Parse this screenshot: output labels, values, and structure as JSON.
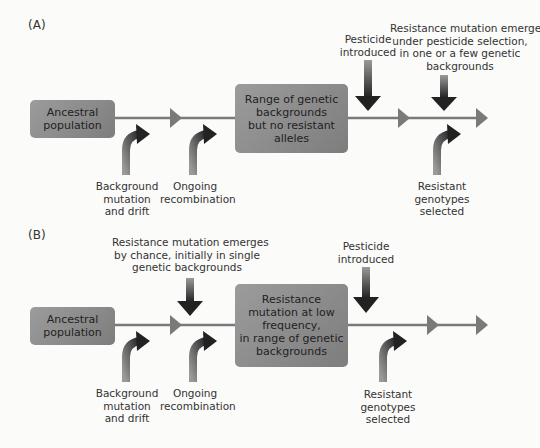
{
  "panels": [
    {
      "label": "(A)",
      "ancestral": "Ancestral population",
      "ancestral_lines": [
        "Ancestral",
        "population"
      ],
      "middle_box_lines": [
        "Range of genetic",
        "backgrounds",
        "but no resistant",
        "alleles"
      ],
      "background_label": [
        "Background",
        "mutation",
        "and drift"
      ],
      "recombination_label": [
        "Ongoing",
        "recombination"
      ],
      "pesticide_label": [
        "Pesticide",
        "introduced"
      ],
      "mutation_label": [
        "Resistance mutation emerges",
        "under pesticide selection,",
        "in one or a few genetic",
        "backgrounds"
      ],
      "resistant_label": [
        "Resistant",
        "genotypes",
        "selected"
      ]
    },
    {
      "label": "(B)",
      "ancestral_lines": [
        "Ancestral",
        "population"
      ],
      "mutation_label": [
        "Resistance mutation emerges",
        "by chance, initially in single",
        "genetic backgrounds"
      ],
      "middle_box_lines": [
        "Resistance",
        "mutation at low",
        "frequency,",
        "in range of genetic",
        "backgrounds"
      ],
      "background_label": [
        "Background",
        "mutation",
        "and drift"
      ],
      "recombination_label": [
        "Ongoing",
        "recombination"
      ],
      "pesticide_label": [
        "Pesticide",
        "introduced"
      ],
      "resistant_label": [
        "Resistant",
        "genotypes",
        "selected"
      ]
    }
  ],
  "colors": {
    "box": "#8a8a8a",
    "line": "#7a7a7a",
    "arrow_dark": "#2a2a2a"
  }
}
